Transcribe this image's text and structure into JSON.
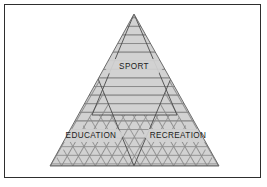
{
  "figure": {
    "type": "venn-triangle-diagram",
    "background_color": "#ffffff",
    "frame_color": "#2e2e2e",
    "fill_color": "#d2d2d2",
    "hatch_color": "#8a8a8a",
    "outline_color": "#6b6b6b",
    "divider_color": "#4a4a4a",
    "label_color": "#1b1b1b"
  },
  "regions": [
    {
      "id": "sport",
      "label": "SPORT",
      "hatch": "horizontal",
      "label_x": 134,
      "label_y": 66
    },
    {
      "id": "education",
      "label": "EDUCATION",
      "hatch": "diagonal-up",
      "label_x": 91,
      "label_y": 135
    },
    {
      "id": "recreation",
      "label": "RECREATION",
      "hatch": "diagonal-down",
      "label_x": 178,
      "label_y": 135
    }
  ],
  "geometry": {
    "outer_triangle": "134,14 219,166 50,166",
    "sport_triangle": "134,14 177,115 92,115",
    "education_triangle": "92,64 134,166 50,166",
    "recreation_triangle": "177,64 219,166 134,166"
  }
}
